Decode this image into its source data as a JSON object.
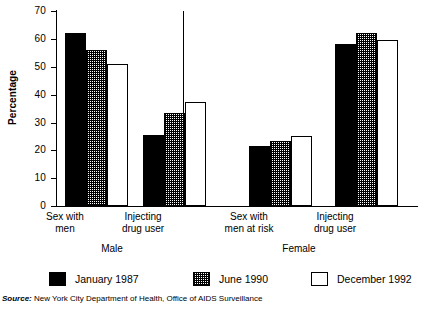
{
  "chart_data": {
    "type": "bar",
    "title": "",
    "xlabel": "",
    "ylabel": "Percentage",
    "ylim": [
      0,
      70
    ],
    "yticks": [
      0,
      10,
      20,
      30,
      40,
      50,
      60,
      70
    ],
    "grid": false,
    "legend_position": "bottom",
    "panels": [
      {
        "name": "Male",
        "categories": [
          "Sex with men",
          "Injecting drug user"
        ]
      },
      {
        "name": "Female",
        "categories": [
          "Sex with men at risk",
          "Injecting drug user"
        ]
      }
    ],
    "categories": [
      "Sex with men",
      "Injecting drug user",
      "Sex with men at risk",
      "Injecting drug user"
    ],
    "series": [
      {
        "name": "January 1987",
        "values": [
          62.0,
          25.5,
          21.5,
          58.0
        ]
      },
      {
        "name": "June 1990",
        "values": [
          56.0,
          33.5,
          23.5,
          62.0
        ]
      },
      {
        "name": "December 1992",
        "values": [
          51.0,
          37.5,
          25.0,
          59.5
        ]
      }
    ],
    "source": {
      "prefix": "Source:",
      "text": "New York City Department of Health, Office of AIDS Surveillance"
    }
  },
  "axis": {
    "y_title": "Percentage",
    "tick_labels": [
      "70",
      "60",
      "50",
      "40",
      "30",
      "20",
      "10",
      "0"
    ]
  },
  "categories": {
    "male_sex_line1": "Sex with",
    "male_sex_line2": "men",
    "male_idu_line1": "Injecting",
    "male_idu_line2": "drug user",
    "female_sex_line1": "Sex with",
    "female_sex_line2": "men at risk",
    "female_idu_line1": "Injecting",
    "female_idu_line2": "drug user"
  },
  "panels": {
    "male": "Male",
    "female": "Female"
  },
  "legend": {
    "items": [
      {
        "label": "January 1987"
      },
      {
        "label": "June 1990"
      },
      {
        "label": "December 1992"
      }
    ]
  },
  "source": {
    "prefix": "Source:",
    "text": " New York City Department of Health, Office of AIDS Surveillance"
  },
  "colors": {
    "series_1987": "#000000",
    "series_1990": "#808080",
    "series_1992": "#ffffff",
    "axis": "#000000",
    "background": "#ffffff"
  }
}
